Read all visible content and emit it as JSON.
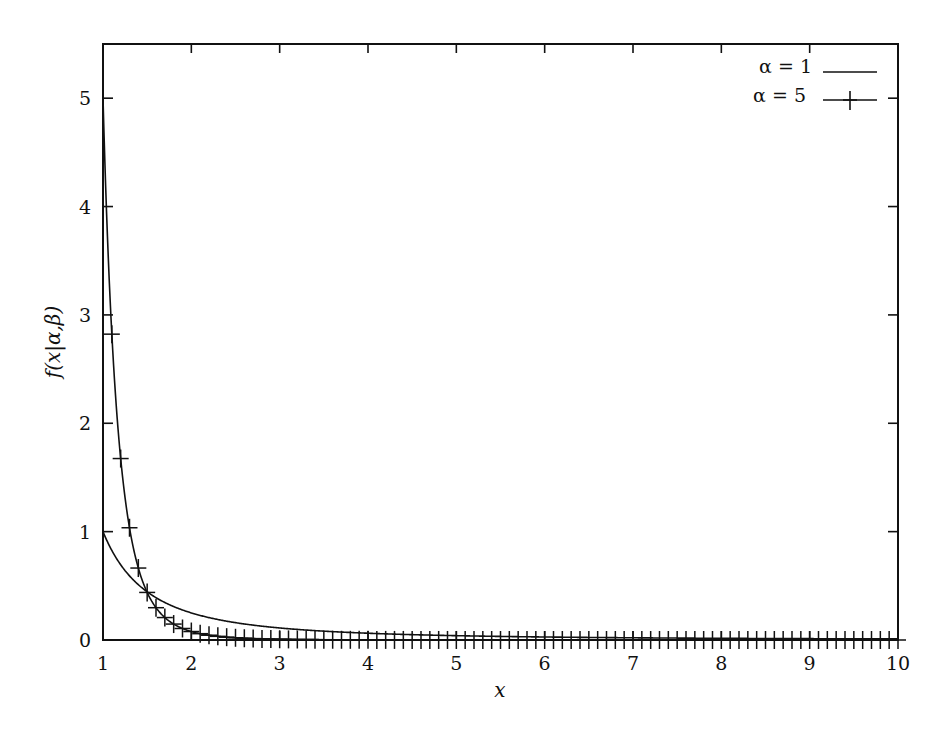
{
  "chart_data": {
    "type": "line",
    "title": "",
    "xlabel": "x",
    "ylabel": "f(x|α,β)",
    "xlim": [
      1,
      10
    ],
    "ylim": [
      0,
      5.5
    ],
    "x_ticks": [
      "1",
      "2",
      "3",
      "4",
      "5",
      "6",
      "7",
      "8",
      "9",
      "10"
    ],
    "y_ticks": [
      "0",
      "1",
      "2",
      "3",
      "4",
      "5"
    ],
    "grid": false,
    "legend_position": "top-right",
    "series": [
      {
        "name": "α = 1",
        "style": "solid line",
        "formula": "alpha / x^(alpha+1), beta = 1",
        "alpha": 1,
        "x": [
          1,
          1.5,
          2,
          2.5,
          3,
          4,
          5,
          6,
          7,
          8,
          9,
          10
        ],
        "values": [
          1.0,
          0.444,
          0.25,
          0.16,
          0.111,
          0.0625,
          0.04,
          0.028,
          0.02,
          0.016,
          0.012,
          0.01
        ]
      },
      {
        "name": "α = 5",
        "style": "line with + markers every 0.1",
        "formula": "alpha / x^(alpha+1), beta = 1",
        "alpha": 5,
        "x": [
          1,
          1.1,
          1.2,
          1.3,
          1.4,
          1.5,
          2,
          2.5,
          3,
          4,
          5,
          6,
          7,
          8,
          9,
          10
        ],
        "values": [
          5.0,
          4.22,
          3.61,
          3.11,
          2.71,
          2.37,
          1.25,
          0.8,
          0.556,
          0.3125,
          0.2,
          0.139,
          0.102,
          0.078,
          0.062,
          0.05
        ]
      }
    ]
  },
  "legend": {
    "items": [
      {
        "label": "α = 1",
        "marker": "line"
      },
      {
        "label": "α = 5",
        "marker": "line-plus"
      }
    ]
  },
  "axes": {
    "x_label": "x",
    "y_label": "f(x|α,β)"
  }
}
